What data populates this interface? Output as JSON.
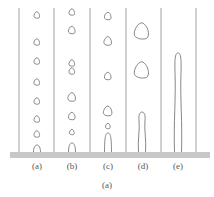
{
  "figure": {
    "caption": "(a)",
    "colors": {
      "line": "#8a8a8a",
      "bubble_stroke": "#6a6a6a",
      "base": "#c8c8c8",
      "text": "#555555"
    },
    "panels": [
      {
        "label": "(a)",
        "description": "small isolated bubbles, evenly spaced",
        "center_x": 37,
        "bubbles": [
          {
            "y": 15,
            "r": 3
          },
          {
            "y": 42,
            "r": 3
          },
          {
            "y": 61,
            "r": 3
          },
          {
            "y": 82,
            "r": 3
          },
          {
            "y": 101,
            "r": 3
          },
          {
            "y": 119,
            "r": 3
          },
          {
            "y": 134,
            "r": 3
          }
        ],
        "attached": {
          "top": 145,
          "width": 7
        }
      },
      {
        "label": "(b)",
        "description": "bubbles with occasional pairing",
        "center_x": 72,
        "bubbles": [
          {
            "y": 12,
            "r": 3
          },
          {
            "y": 30,
            "r": 3.5
          },
          {
            "y": 63,
            "r": 3
          },
          {
            "y": 71,
            "r": 3
          },
          {
            "y": 97,
            "r": 4
          },
          {
            "y": 116,
            "r": 3.5
          },
          {
            "y": 132,
            "r": 2.5
          }
        ],
        "attached": {
          "top": 143,
          "width": 7
        }
      },
      {
        "label": "(c)",
        "description": "larger bubbles, slug begins forming",
        "center_x": 108,
        "bubbles": [
          {
            "y": 16,
            "r": 3.5
          },
          {
            "y": 41,
            "r": 4
          },
          {
            "y": 76,
            "r": 3.5
          },
          {
            "y": 111,
            "r": 4.5
          },
          {
            "y": 126,
            "r": 2.5
          }
        ],
        "attached": {
          "top": 133,
          "width": 7
        }
      },
      {
        "label": "(d)",
        "description": "large bubbles with elongated column",
        "center_x": 142,
        "bubbles": [
          {
            "y": 31,
            "r": 7.5
          },
          {
            "y": 70,
            "r": 7.5
          }
        ],
        "attached": {
          "top": 112,
          "width": 7
        }
      },
      {
        "label": "(e)",
        "description": "continuous vapor column",
        "center_x": 178,
        "bubbles": [],
        "attached": {
          "top": 53,
          "width": 7
        }
      }
    ],
    "divider_x": [
      19,
      54,
      90,
      126,
      161,
      196
    ],
    "divider_top": 8,
    "base": {
      "x": 10,
      "y": 152,
      "width": 200,
      "height": 6
    },
    "label_y": 162,
    "caption_y": 181
  }
}
